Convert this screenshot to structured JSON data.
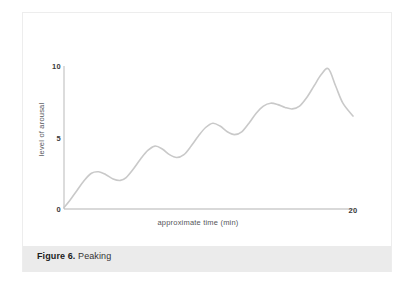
{
  "figure": {
    "caption_prefix": "Figure 6.",
    "caption_title": "Peaking"
  },
  "chart_data": {
    "type": "line",
    "title": "",
    "subtitle": "",
    "xlabel": "approximate time (min)",
    "ylabel": "level of arousal",
    "xlim": [
      0,
      20
    ],
    "ylim": [
      0,
      10
    ],
    "xticks": [
      0,
      20
    ],
    "xtick_labels": [
      "0",
      "20"
    ],
    "yticks": [
      0,
      5,
      10
    ],
    "ytick_labels": [
      "0",
      "5",
      "10"
    ],
    "grid": false,
    "legend": null,
    "legend_position": "none",
    "line_color": "#c9c9c9",
    "axis_color": "#b6b6b6",
    "series": [
      {
        "name": "arousal",
        "x": [
          0.0,
          0.4,
          0.9,
          1.4,
          1.9,
          2.4,
          2.9,
          3.4,
          3.9,
          4.3,
          4.8,
          5.3,
          5.8,
          6.3,
          6.8,
          7.3,
          7.8,
          8.3,
          8.8,
          9.3,
          9.8,
          10.3,
          10.8,
          11.3,
          11.8,
          12.3,
          12.8,
          13.3,
          13.8,
          14.3,
          14.8,
          15.3,
          15.8,
          16.3,
          16.8,
          17.3,
          17.8,
          18.3,
          18.8,
          19.3,
          20.0
        ],
        "values": [
          0.1,
          0.6,
          1.3,
          2.0,
          2.5,
          2.6,
          2.4,
          2.1,
          2.0,
          2.2,
          2.8,
          3.5,
          4.1,
          4.4,
          4.2,
          3.8,
          3.6,
          3.8,
          4.4,
          5.1,
          5.7,
          6.0,
          5.8,
          5.4,
          5.2,
          5.4,
          6.0,
          6.7,
          7.2,
          7.4,
          7.3,
          7.1,
          7.0,
          7.2,
          7.8,
          8.6,
          9.4,
          9.8,
          8.6,
          7.4,
          6.5
        ]
      }
    ],
    "annotations": []
  }
}
